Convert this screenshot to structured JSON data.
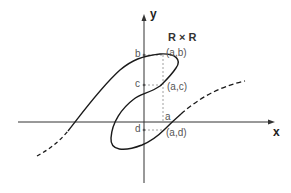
{
  "diagram": {
    "title": "R × R",
    "axes": {
      "x_label": "x",
      "y_label": "y"
    },
    "y_ticks": [
      {
        "label": "b"
      },
      {
        "label": "c"
      },
      {
        "label": "d"
      }
    ],
    "x_ticks": [
      {
        "label": "a"
      }
    ],
    "points": [
      {
        "label": "(a,b)"
      },
      {
        "label": "(a,c)"
      },
      {
        "label": "(a,d)"
      }
    ],
    "colors": {
      "curve": "#1a1a1a",
      "axis": "#333333",
      "guide": "#888888",
      "label": "#555555"
    }
  }
}
